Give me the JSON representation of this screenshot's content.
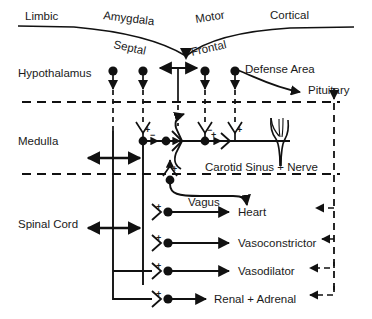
{
  "diagram": {
    "top_curve_labels": [
      {
        "id": "limbic",
        "text": "Limbic"
      },
      {
        "id": "amygdala",
        "text": "Amygdala"
      },
      {
        "id": "motor",
        "text": "Motor"
      },
      {
        "id": "cortical",
        "text": "Cortical"
      },
      {
        "id": "septal",
        "text": "Septal"
      },
      {
        "id": "frontal",
        "text": "Frontal"
      }
    ],
    "region_labels": [
      {
        "id": "hypothalamus",
        "text": "Hypothalamus"
      },
      {
        "id": "medulla",
        "text": "Medulla"
      },
      {
        "id": "spinal-cord",
        "text": "Spinal Cord"
      }
    ],
    "structure_labels": [
      {
        "id": "defense-area",
        "text": "Defense Area"
      },
      {
        "id": "pituitary",
        "text": "Pituitary"
      },
      {
        "id": "carotid-sinus",
        "text": "Carotid Sinus + Nerve"
      },
      {
        "id": "vagus",
        "text": "Vagus"
      }
    ],
    "effector_labels": [
      {
        "id": "heart",
        "text": "Heart"
      },
      {
        "id": "vasoconstrictor",
        "text": "Vasoconstrictor"
      },
      {
        "id": "vasodilator",
        "text": "Vasodilator"
      },
      {
        "id": "renal-adrenal",
        "text": "Renal + Adrenal"
      }
    ],
    "synapse_signs": [
      {
        "id": "medulla-sign-1",
        "text": "+"
      },
      {
        "id": "medulla-sign-2",
        "text": "−"
      },
      {
        "id": "medulla-sign-3",
        "text": "+"
      },
      {
        "id": "medulla-sign-4",
        "text": "−"
      },
      {
        "id": "medulla-sign-5",
        "text": "+"
      },
      {
        "id": "medulla-sign-6",
        "text": "+"
      },
      {
        "id": "baroreceptor-sign",
        "text": "+"
      },
      {
        "id": "heart-sign",
        "text": "+"
      },
      {
        "id": "vasoconstrictor-sign",
        "text": "+"
      },
      {
        "id": "vasodilator-sign",
        "text": "+"
      },
      {
        "id": "renal-sign",
        "text": "+"
      }
    ],
    "colors": {
      "ink": "#111111",
      "text": "#1a1a1a",
      "background": "#ffffff"
    }
  }
}
